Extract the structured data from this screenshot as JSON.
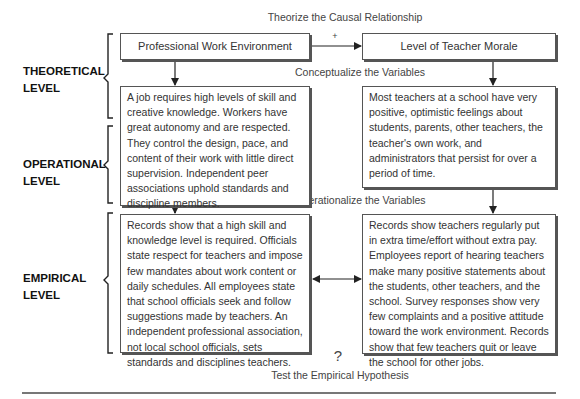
{
  "diagram": {
    "top_caption": "Theorize the Causal Relationship",
    "conceptualize_caption": "Conceptualize the Variables",
    "operationalize_caption": "Operationalize the Variables",
    "bottom_caption": "Test the Empirical Hypothesis",
    "relationship_sign": "+",
    "empirical_question_mark": "?",
    "levels": [
      {
        "line1": "THEORETICAL",
        "line2": "LEVEL"
      },
      {
        "line1": "OPERATIONAL",
        "line2": "LEVEL"
      },
      {
        "line1": "EMPIRICAL",
        "line2": "LEVEL"
      }
    ],
    "variables": {
      "independent": {
        "name": "Professional Work Environment",
        "conceptual_definition": "A job requires high levels of skill and creative knowledge. Workers have great autonomy and are respected. They control the design, pace, and content of their work with little direct supervision. Independent peer associations uphold standards and discipline members.",
        "empirical_measure": "Records show that a high skill and knowledge level is required. Officials state respect for teachers and impose few mandates about work content or daily schedules. All employees state that school officials seek and follow suggestions made by teachers. An independent professional association, not local school officials, sets standards and disciplines teachers."
      },
      "dependent": {
        "name": "Level of Teacher Morale",
        "conceptual_definition": "Most teachers at a school have very positive, optimistic feelings about students, parents, other teachers, the teacher's own work, and administrators that persist for over a period of time.",
        "empirical_measure": "Records show teachers regularly put in extra time/effort without extra pay. Employees report of hearing teachers make many positive statements about the students, other teachers, and the school. Survey responses show very few complaints and a positive attitude toward the work environment. Records show that few teachers quit or leave the school for other jobs."
      }
    }
  }
}
